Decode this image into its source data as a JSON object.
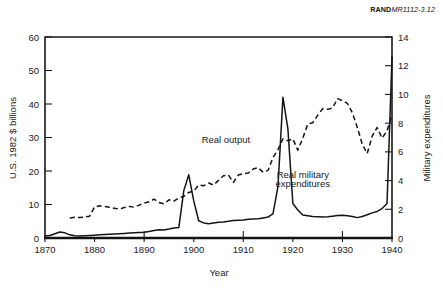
{
  "figure": {
    "report_id_bold": "RAND",
    "report_id_italic": "MR1112-3.12"
  },
  "chart_data": {
    "type": "line",
    "title": "",
    "xlabel": "Year",
    "ylabel": "U.S. 1982 $ billions",
    "y2label": "Military expenditures",
    "xlim": [
      1870,
      1940
    ],
    "ylim": [
      0,
      60
    ],
    "y2lim": [
      0,
      14
    ],
    "grid": false,
    "legend": "inline-annotations",
    "xticks": [
      1870,
      1880,
      1890,
      1900,
      1910,
      1920,
      1930,
      1940
    ],
    "xticklabels": [
      "1870",
      "1880",
      "1890",
      "1900",
      "1910",
      "1920",
      "1930",
      "1940"
    ],
    "yticks": [
      0,
      10,
      20,
      30,
      40,
      50,
      60
    ],
    "yticklabels": [
      "0",
      "10",
      "20",
      "30",
      "40",
      "50",
      "60"
    ],
    "y2ticks": [
      0,
      2,
      4,
      6,
      8,
      10,
      12,
      14
    ],
    "y2ticklabels": [
      "0",
      "2",
      "4",
      "6",
      "8",
      "10",
      "12",
      "14"
    ],
    "annotations": [
      {
        "text": "Real output",
        "x": 1906.5,
        "y_axis": "left",
        "y": 28.5
      },
      {
        "text": "Real military",
        "x": 1922.0,
        "y_axis": "left",
        "y": 18.0
      },
      {
        "text": "expenditures",
        "x": 1922.0,
        "y_axis": "left",
        "y": 15.2
      }
    ],
    "series": [
      {
        "name": "Real output",
        "style": "dashed",
        "axis": "left",
        "x": [
          1875,
          1876,
          1877,
          1878,
          1879,
          1880,
          1881,
          1882,
          1883,
          1884,
          1885,
          1886,
          1887,
          1888,
          1889,
          1890,
          1891,
          1892,
          1893,
          1894,
          1895,
          1896,
          1897,
          1898,
          1899,
          1900,
          1901,
          1902,
          1903,
          1904,
          1905,
          1906,
          1907,
          1908,
          1909,
          1910,
          1911,
          1912,
          1913,
          1914,
          1915,
          1916,
          1917,
          1918,
          1919,
          1920,
          1921,
          1922,
          1923,
          1924,
          1925,
          1926,
          1927,
          1928,
          1929,
          1930,
          1931,
          1932,
          1933,
          1934,
          1935,
          1936,
          1937,
          1938,
          1939,
          1940
        ],
        "values": [
          6.0,
          6.2,
          6.1,
          6.3,
          6.5,
          9.3,
          9.6,
          9.4,
          9.2,
          8.9,
          8.6,
          9.1,
          9.4,
          9.2,
          9.8,
          10.4,
          10.8,
          11.6,
          10.6,
          10.2,
          11.4,
          11.0,
          12.0,
          12.4,
          13.6,
          14.0,
          15.8,
          15.6,
          16.4,
          15.8,
          17.2,
          18.6,
          18.8,
          16.6,
          18.8,
          19.2,
          19.4,
          20.6,
          21.0,
          19.6,
          20.2,
          24.0,
          26.4,
          29.6,
          29.0,
          29.6,
          26.2,
          29.8,
          34.0,
          34.4,
          36.6,
          38.6,
          38.4,
          38.8,
          41.6,
          41.0,
          40.2,
          37.4,
          33.0,
          28.0,
          25.2,
          30.4,
          33.0,
          29.8,
          32.0,
          37.0
        ]
      },
      {
        "name": "Real military expenditures",
        "style": "solid",
        "axis": "right",
        "x": [
          1870,
          1871,
          1872,
          1873,
          1874,
          1875,
          1876,
          1877,
          1878,
          1879,
          1880,
          1881,
          1882,
          1883,
          1884,
          1885,
          1886,
          1887,
          1888,
          1889,
          1890,
          1891,
          1892,
          1893,
          1894,
          1895,
          1896,
          1897,
          1898,
          1899,
          1900,
          1901,
          1902,
          1903,
          1904,
          1905,
          1906,
          1907,
          1908,
          1909,
          1910,
          1911,
          1912,
          1913,
          1914,
          1915,
          1916,
          1917,
          1918,
          1919,
          1920,
          1921,
          1922,
          1923,
          1924,
          1925,
          1926,
          1927,
          1928,
          1929,
          1930,
          1931,
          1932,
          1933,
          1934,
          1935,
          1936,
          1937,
          1938,
          1939,
          1940
        ],
        "values": [
          0.14,
          0.18,
          0.3,
          0.42,
          0.36,
          0.22,
          0.16,
          0.14,
          0.16,
          0.18,
          0.2,
          0.22,
          0.24,
          0.26,
          0.28,
          0.3,
          0.32,
          0.34,
          0.36,
          0.38,
          0.4,
          0.46,
          0.52,
          0.58,
          0.56,
          0.62,
          0.7,
          0.74,
          3.3,
          4.4,
          2.6,
          1.2,
          1.05,
          1.0,
          1.05,
          1.1,
          1.12,
          1.16,
          1.22,
          1.24,
          1.26,
          1.3,
          1.32,
          1.34,
          1.4,
          1.46,
          1.7,
          3.6,
          9.8,
          7.6,
          2.4,
          1.95,
          1.6,
          1.55,
          1.5,
          1.48,
          1.46,
          1.48,
          1.52,
          1.56,
          1.58,
          1.55,
          1.5,
          1.42,
          1.5,
          1.62,
          1.75,
          1.85,
          2.05,
          2.4,
          12.6
        ]
      }
    ]
  }
}
